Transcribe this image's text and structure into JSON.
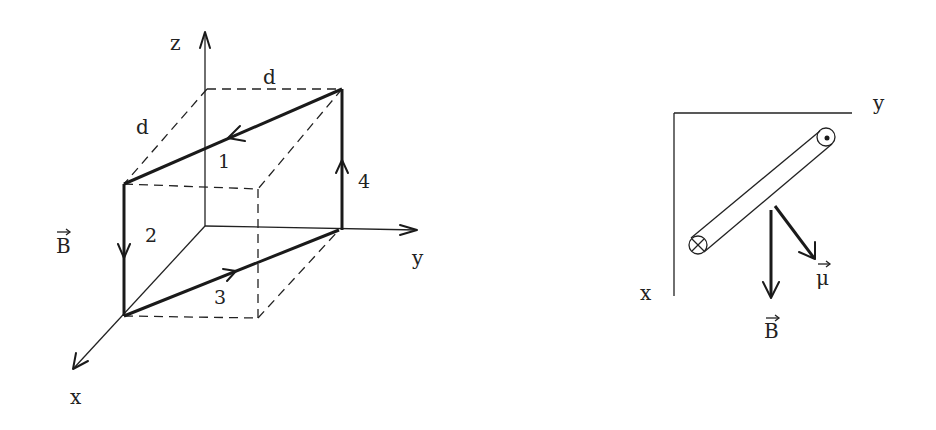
{
  "figure_left": {
    "title": "Square current loop in 3D coordinates",
    "axes": {
      "x": "x",
      "y": "y",
      "z": "z"
    },
    "dimensions": {
      "width_label": "d",
      "depth_label": "d"
    },
    "field_label": "B",
    "field_arrow_symbol": "→",
    "segments": [
      {
        "id": 1,
        "label": "1"
      },
      {
        "id": 2,
        "label": "2"
      },
      {
        "id": 3,
        "label": "3"
      },
      {
        "id": 4,
        "label": "4"
      }
    ]
  },
  "figure_right": {
    "title": "Top view of loop in xy-plane",
    "axes": {
      "x": "x",
      "y": "y"
    },
    "field_label": "B",
    "moment_label": "μ",
    "vector_arrow_symbol": "→",
    "current_in_symbol": "⊗",
    "current_out_symbol": "⊙"
  }
}
